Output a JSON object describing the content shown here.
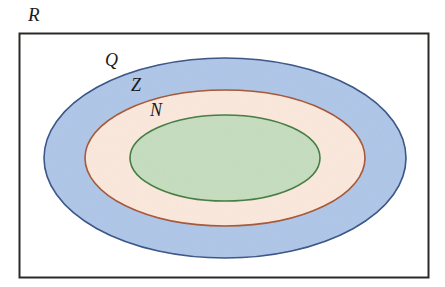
{
  "figure": {
    "universe": {
      "label": "R",
      "name": "real-numbers-universe",
      "shape": "rectangle",
      "border_color": "#2b2a26",
      "fill_color": "#ffffff",
      "x": 19,
      "y": 33,
      "width": 409,
      "height": 244
    },
    "sets": [
      {
        "label": "Q",
        "name": "rational-numbers-ellipse",
        "shape": "ellipse",
        "fill_color": "#aec6e8",
        "stroke_color": "#2f4f86",
        "cx": 225,
        "cy": 158,
        "rx": 181,
        "ry": 100
      },
      {
        "label": "Z",
        "name": "integers-ellipse",
        "shape": "ellipse",
        "fill_color": "#fbe8dc",
        "stroke_color": "#a6522c",
        "cx": 225,
        "cy": 158,
        "rx": 140,
        "ry": 68
      },
      {
        "label": "N",
        "name": "natural-numbers-ellipse",
        "shape": "ellipse",
        "fill_color": "#c5ddbf",
        "stroke_color": "#3e7a3a",
        "cx": 225,
        "cy": 158,
        "rx": 95,
        "ry": 43
      }
    ]
  },
  "chart_data": {
    "type": "diagram",
    "diagram_kind": "euler-nested-sets",
    "title": "",
    "nesting_order": [
      "N",
      "Z",
      "Q",
      "R"
    ],
    "labels": [
      "R",
      "Q",
      "Z",
      "N"
    ],
    "label_positions": [
      {
        "label": "R",
        "x": 28,
        "y": 5
      },
      {
        "label": "Q",
        "x": 105,
        "y": 51
      },
      {
        "label": "Z",
        "x": 131,
        "y": 76
      },
      {
        "label": "N",
        "x": 150,
        "y": 101
      }
    ],
    "colors": {
      "R": "#ffffff",
      "Q": "#aec6e8",
      "Z": "#fbe8dc",
      "N": "#c5ddbf"
    },
    "stroke_colors": {
      "R": "#2b2a26",
      "Q": "#2f4f86",
      "Z": "#a6522c",
      "N": "#3e7a3a"
    }
  }
}
